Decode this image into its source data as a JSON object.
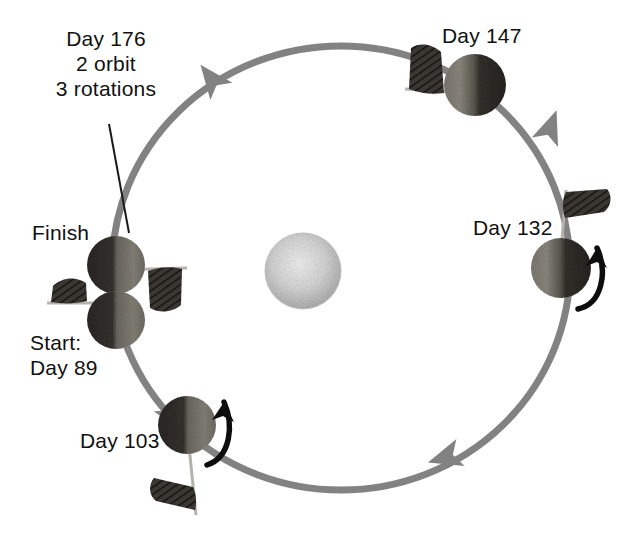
{
  "figure": {
    "background_color": "#ffffff",
    "orbit_color": "#808080",
    "text_color": "#111111",
    "rotation_arrow_color": "#000000",
    "leader_line_color": "#000000"
  },
  "sun": {
    "name": "central-star",
    "cx": 303,
    "cy": 271,
    "r": 38,
    "fill_light": "#e8e8e8",
    "fill_mid": "#c9c9c9",
    "fill_dark": "#ababab"
  },
  "orbit": {
    "cx": 341,
    "cy": 268,
    "rx": 229,
    "ry": 222,
    "stroke_width": 7,
    "direction": "counter-clockwise",
    "arrowheads": [
      {
        "name": "orbit-arrow-top",
        "x": 212,
        "y": 79,
        "angle": -132
      },
      {
        "name": "orbit-arrow-right",
        "x": 547,
        "y": 128,
        "angle": -65
      },
      {
        "name": "orbit-arrow-bottom-right",
        "x": 448,
        "y": 457,
        "angle": 160
      },
      {
        "name": "orbit-arrow-lower-left",
        "x": 168,
        "y": 410,
        "angle": 56
      }
    ]
  },
  "annotation": {
    "lines": "Day 176\n2 orbit\n3 rotations",
    "leader_from": {
      "x": 109,
      "y": 125
    },
    "leader_to": {
      "x": 128,
      "y": 232
    }
  },
  "labels": {
    "finish": "Finish",
    "start": "Start:\nDay 89",
    "day103": "Day 103",
    "day132": "Day 132",
    "day147": "Day 147"
  },
  "planets": [
    {
      "id": "finish",
      "name": "planet-finish",
      "label": "Finish",
      "cx": 116,
      "cy": 265,
      "r": 29,
      "lit_side": "right",
      "flag": {
        "name": "flag-finish",
        "orientation": "pole-horizontal-right",
        "pole_x1": 116,
        "pole_y1": 271,
        "pole_x2": 185,
        "pole_y2": 269,
        "banner": "hangs-down-right"
      },
      "rotation_arrow": false
    },
    {
      "id": "start",
      "name": "planet-start",
      "label": "Start: Day 89",
      "cx": 116,
      "cy": 320,
      "r": 29,
      "lit_side": "right",
      "flag": {
        "name": "flag-start",
        "orientation": "pole-horizontal-left",
        "pole_x1": 116,
        "pole_y1": 303,
        "pole_x2": 48,
        "pole_y2": 303,
        "banner": "stands-up-left"
      },
      "rotation_arrow": false
    },
    {
      "id": "day103",
      "name": "planet-day-103",
      "label": "Day 103",
      "cx": 187,
      "cy": 425,
      "r": 29,
      "lit_side": "right",
      "flag": {
        "name": "flag-day-103",
        "orientation": "pole-vertical-down",
        "pole_x1": 187,
        "pole_y1": 436,
        "pole_x2": 196,
        "pole_y2": 512,
        "banner": "extends-left"
      },
      "rotation_arrow": true,
      "rotation_arrow_dir": "counter-clockwise-right-side"
    },
    {
      "id": "day132",
      "name": "planet-day-132",
      "label": "Day 132",
      "cx": 561,
      "cy": 268,
      "r": 30,
      "lit_side": "left",
      "flag": {
        "name": "flag-day-132",
        "orientation": "pole-vertical-up",
        "pole_x1": 561,
        "pole_y1": 258,
        "pole_x2": 566,
        "pole_y2": 192,
        "banner": "extends-right"
      },
      "rotation_arrow": true,
      "rotation_arrow_dir": "counter-clockwise-right-side"
    },
    {
      "id": "day147",
      "name": "planet-day-147",
      "label": "Day 147",
      "cx": 475,
      "cy": 85,
      "r": 31,
      "lit_side": "left",
      "flag": {
        "name": "flag-day-147",
        "orientation": "pole-horizontal-left",
        "pole_x1": 475,
        "pole_y1": 92,
        "pole_x2": 409,
        "pole_y2": 90,
        "banner": "stands-up-left"
      },
      "rotation_arrow": false
    }
  ]
}
